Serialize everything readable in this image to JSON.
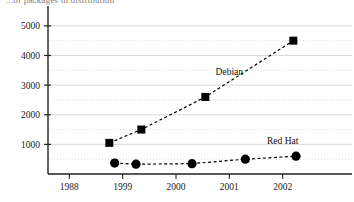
{
  "title_fragment": "...of packages in distribution",
  "chart_data": {
    "type": "line",
    "title": "",
    "xlabel": "",
    "ylabel": "",
    "xlim": [
      1997.6,
      2003.3
    ],
    "ylim": [
      0,
      5400
    ],
    "grid": true,
    "legend_position": "inline-annotation",
    "yticks": [
      1000,
      2000,
      3000,
      4000,
      5000
    ],
    "ytick_labels": [
      "1000",
      "2000",
      "3000",
      "4000",
      "5000"
    ],
    "minor_yticks": [
      500,
      1500,
      2500,
      3500,
      4500,
      5000
    ],
    "xticks": [
      1998,
      1999,
      2000,
      2001,
      2002
    ],
    "xtick_labels": [
      "1988",
      "1999",
      "2000",
      "2001",
      "2002"
    ],
    "series": [
      {
        "name": "Debian",
        "marker": "square",
        "color": "#000000",
        "linestyle": "dashed",
        "x": [
          1998.75,
          1999.35,
          2000.55,
          2002.2
        ],
        "values": [
          1050,
          1500,
          2600,
          4500
        ]
      },
      {
        "name": "Red Hat",
        "marker": "circle",
        "color": "#000000",
        "linestyle": "dashed",
        "x": [
          1998.85,
          1999.25,
          2000.3,
          2001.3,
          2002.25
        ],
        "values": [
          370,
          330,
          350,
          500,
          600
        ]
      }
    ],
    "annotations": [
      {
        "text": "Debian",
        "x": 2001.0,
        "y": 3350
      },
      {
        "text": "Red Hat",
        "x": 2002.0,
        "y": 1010
      }
    ]
  }
}
